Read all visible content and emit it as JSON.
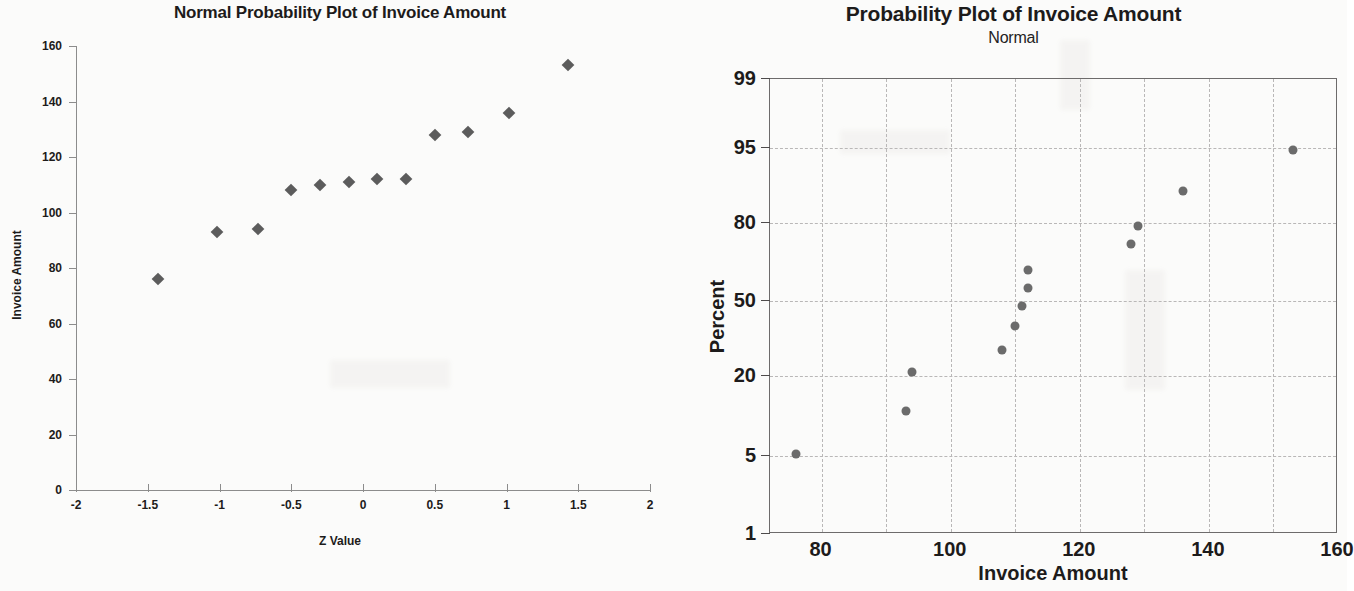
{
  "left_chart": {
    "title": "Normal Probability Plot of Invoice Amount",
    "xlabel": "Z Value",
    "ylabel": "Invoice Amount",
    "x_ticks": [
      "-2",
      "-1.5",
      "-1",
      "-0.5",
      "0",
      "0.5",
      "1",
      "1.5",
      "2"
    ],
    "y_ticks": [
      "0",
      "20",
      "40",
      "60",
      "80",
      "100",
      "120",
      "140",
      "160"
    ]
  },
  "right_chart": {
    "title": "Probability Plot of Invoice Amount",
    "subtitle": "Normal",
    "xlabel": "Invoice Amount",
    "ylabel": "Percent",
    "x_ticks": [
      "80",
      "100",
      "120",
      "140",
      "160"
    ],
    "y_ticks": [
      "1",
      "5",
      "20",
      "50",
      "80",
      "95",
      "99"
    ]
  },
  "colors": {
    "marker": "#5c5c5c",
    "dot": "#6b6b6b",
    "axis": "#8c8c8c",
    "frame": "#6d6b6b",
    "grid": "#b9b7b7",
    "text": "#1d1b1b",
    "background": "#fbfbfa"
  },
  "chart_data": [
    {
      "type": "scatter",
      "title": "Normal Probability Plot of Invoice Amount",
      "xlabel": "Z Value",
      "ylabel": "Invoice Amount",
      "xlim": [
        -2,
        2
      ],
      "ylim": [
        0,
        160
      ],
      "xticks": [
        -2,
        -1.5,
        -1,
        -0.5,
        0,
        0.5,
        1,
        1.5,
        2
      ],
      "yticks": [
        0,
        20,
        40,
        60,
        80,
        100,
        120,
        140,
        160
      ],
      "grid": false,
      "legend": "none",
      "marker": "diamond",
      "x": [
        -1.43,
        -1.02,
        -0.73,
        -0.5,
        -0.3,
        -0.1,
        0.1,
        0.3,
        0.5,
        0.73,
        1.02,
        1.43
      ],
      "y": [
        76,
        93,
        94,
        108,
        110,
        111,
        112,
        112,
        128,
        129,
        136,
        153
      ],
      "points": [
        {
          "x": -1.43,
          "y": 76
        },
        {
          "x": -1.02,
          "y": 93
        },
        {
          "x": -0.73,
          "y": 94
        },
        {
          "x": -0.5,
          "y": 108
        },
        {
          "x": -0.3,
          "y": 110
        },
        {
          "x": -0.1,
          "y": 111
        },
        {
          "x": 0.1,
          "y": 112
        },
        {
          "x": 0.3,
          "y": 112
        },
        {
          "x": 0.5,
          "y": 128
        },
        {
          "x": 0.73,
          "y": 129
        },
        {
          "x": 1.02,
          "y": 136
        },
        {
          "x": 1.43,
          "y": 153
        }
      ]
    },
    {
      "type": "scatter",
      "title": "Probability Plot of Invoice Amount",
      "subtitle": "Normal",
      "xlabel": "Invoice Amount",
      "ylabel": "Percent",
      "xlim": [
        72,
        160
      ],
      "ylim": [
        1,
        99
      ],
      "yscale": "normal-probability",
      "xticks": [
        80,
        100,
        120,
        140,
        160
      ],
      "yticks": [
        1,
        5,
        20,
        50,
        80,
        95,
        99
      ],
      "x_gridlines": [
        80,
        90,
        100,
        110,
        120,
        130,
        140,
        150
      ],
      "y_gridlines": [
        5,
        20,
        50,
        80,
        95
      ],
      "grid": true,
      "legend": "none",
      "marker": "circle",
      "x": [
        76,
        93,
        94,
        108,
        110,
        111,
        112,
        112,
        128,
        129,
        136,
        153
      ],
      "y": [
        5.4,
        13.5,
        21.5,
        30.5,
        40.0,
        48.0,
        55.0,
        62.0,
        72.0,
        79.0,
        86.5,
        94.6
      ],
      "points": [
        {
          "x": 76,
          "y": 5.4
        },
        {
          "x": 93,
          "y": 13.5
        },
        {
          "x": 94,
          "y": 21.5
        },
        {
          "x": 108,
          "y": 30.5
        },
        {
          "x": 110,
          "y": 40.0
        },
        {
          "x": 111,
          "y": 48.0
        },
        {
          "x": 112,
          "y": 55.0
        },
        {
          "x": 112,
          "y": 62.0
        },
        {
          "x": 128,
          "y": 72.0
        },
        {
          "x": 129,
          "y": 79.0
        },
        {
          "x": 136,
          "y": 86.5
        },
        {
          "x": 153,
          "y": 94.6
        }
      ]
    }
  ]
}
